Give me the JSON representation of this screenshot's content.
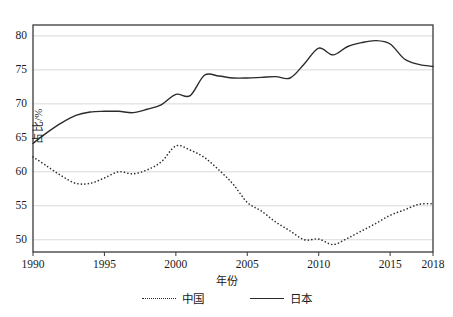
{
  "chart_data": {
    "type": "line",
    "title": "",
    "xlabel": "年份",
    "ylabel": "占比/%",
    "xlim": [
      1990,
      2018
    ],
    "ylim": [
      48.2,
      81.6
    ],
    "grid": true,
    "grid_axis": "y",
    "legend_position": "bottom",
    "xticks": [
      "1990",
      "1995",
      "2000",
      "2005",
      "2010",
      "2015",
      "2018"
    ],
    "xtick_values": [
      1990,
      1995,
      2000,
      2005,
      2010,
      2015,
      2018
    ],
    "yticks": [
      "50",
      "55",
      "60",
      "65",
      "70",
      "75",
      "80"
    ],
    "ytick_values": [
      50,
      55,
      60,
      65,
      70,
      75,
      80
    ],
    "x": [
      1990,
      1991,
      1992,
      1993,
      1994,
      1995,
      1996,
      1997,
      1998,
      1999,
      2000,
      2001,
      2002,
      2003,
      2004,
      2005,
      2006,
      2007,
      2008,
      2009,
      2010,
      2011,
      2012,
      2013,
      2014,
      2015,
      2016,
      2017,
      2018
    ],
    "series": [
      {
        "name": "中国",
        "style": "dotted",
        "color": "#2b2b2b",
        "values": [
          62.2,
          60.8,
          59.4,
          58.3,
          58.3,
          59.1,
          60.0,
          59.7,
          60.3,
          61.5,
          63.8,
          63.2,
          62.1,
          60.3,
          58.2,
          55.5,
          54.2,
          52.6,
          51.3,
          50.0,
          50.1,
          49.3,
          50.2,
          51.3,
          52.4,
          53.6,
          54.4,
          55.2,
          55.3
        ]
      },
      {
        "name": "日本",
        "style": "solid",
        "color": "#2b2b2b",
        "values": [
          64.2,
          65.8,
          67.2,
          68.3,
          68.8,
          68.9,
          68.9,
          68.7,
          69.2,
          69.9,
          71.4,
          71.2,
          74.2,
          74.1,
          73.8,
          73.8,
          73.9,
          74.0,
          73.8,
          75.9,
          78.2,
          77.2,
          78.4,
          79.0,
          79.3,
          78.8,
          76.6,
          75.8,
          75.5
        ]
      }
    ]
  },
  "axes": {
    "y_title": "占比/%",
    "x_title": "年份"
  },
  "legend": {
    "entries": [
      {
        "label": "中国",
        "style": "dotted"
      },
      {
        "label": "日本",
        "style": "solid"
      }
    ]
  }
}
